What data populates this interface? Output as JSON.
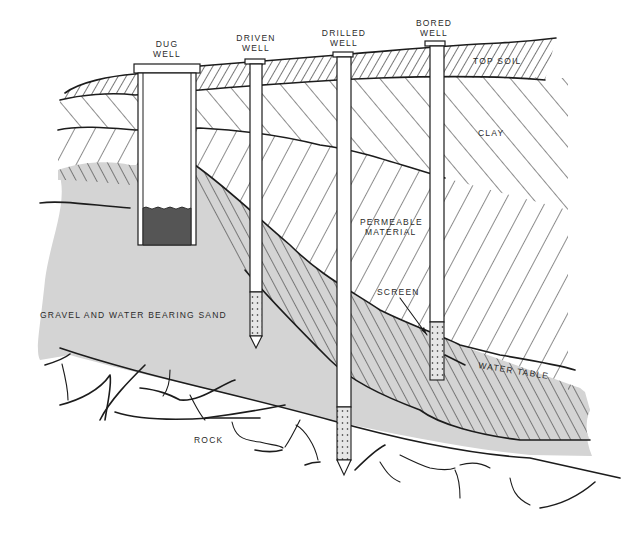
{
  "diagram": {
    "type": "cross-section",
    "wells": [
      {
        "id": "dug",
        "label_line1": "DUG",
        "label_line2": "WELL"
      },
      {
        "id": "driven",
        "label_line1": "DRIVEN",
        "label_line2": "WELL"
      },
      {
        "id": "drilled",
        "label_line1": "DRILLED",
        "label_line2": "WELL"
      },
      {
        "id": "bored",
        "label_line1": "BORED",
        "label_line2": "WELL"
      }
    ],
    "layers": {
      "top_soil": "TOP SOIL",
      "clay": "CLAY",
      "permeable_line1": "PERMEABLE",
      "permeable_line2": "MATERIAL",
      "screen": "SCREEN",
      "gravel_sand": "GRAVEL AND WATER BEARING SAND",
      "water_table": "WATER TABLE",
      "rock": "ROCK"
    },
    "colors": {
      "ink": "#1c1c1c",
      "sand_fill": "#d4d4d4",
      "water_fill": "#555555",
      "background": "#ffffff"
    }
  }
}
